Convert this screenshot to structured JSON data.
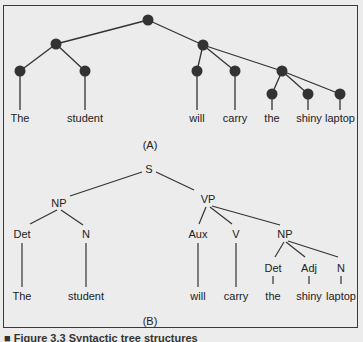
{
  "figure": {
    "caption": "■ Figure 3.3 Syntactic tree structures",
    "panel_a": {
      "label": "(A)",
      "words": [
        "The",
        "student",
        "will",
        "carry",
        "the",
        "shiny",
        "laptop"
      ]
    },
    "panel_b": {
      "label": "(B)",
      "root": "S",
      "subject_np": "NP",
      "subject_det": "Det",
      "subject_n": "N",
      "vp": "VP",
      "aux": "Aux",
      "verb": "V",
      "object_np": "NP",
      "object_det": "Det",
      "object_adj": "Adj",
      "object_n": "N",
      "words": [
        "The",
        "student",
        "will",
        "carry",
        "the",
        "shiny",
        "laptop"
      ]
    },
    "colors": {
      "node": "#333333",
      "line": "#333333",
      "background": "#ececec"
    }
  }
}
